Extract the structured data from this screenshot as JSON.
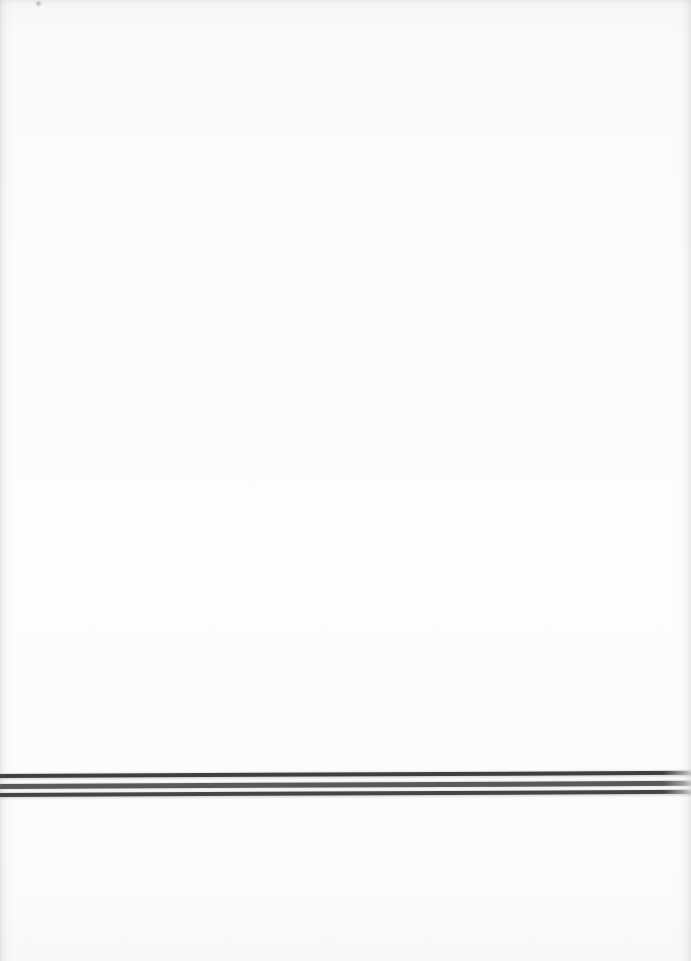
{
  "document": {
    "kind": "scanned-page",
    "page_width": 691,
    "page_height": 961,
    "paper_color": "#fbfbfb",
    "content_summary": "Blank scanned page with three horizontal dark rules near the bottom",
    "text_content": "",
    "has_text": false
  },
  "rules": {
    "count": 3,
    "left_x": 0,
    "right_x": 691,
    "skew_degrees": -0.26,
    "items": [
      {
        "name": "rule-1",
        "top": 774,
        "thickness": 4.2,
        "color": "#3f3f3f",
        "tone": "darkest"
      },
      {
        "name": "rule-2",
        "top": 783.5,
        "thickness": 4.6,
        "color": "#595959",
        "tone": "medium"
      },
      {
        "name": "rule-3",
        "top": 792.5,
        "thickness": 4.4,
        "color": "#454545",
        "tone": "dark"
      }
    ]
  },
  "artifacts": {
    "speck": {
      "name": "scan-speck",
      "x": 35,
      "y": 0,
      "width": 7,
      "height": 7,
      "color": "#8e8e8e"
    }
  },
  "edges": {
    "left_shadow_color": "#969696",
    "right_shadow_color": "#969696",
    "top_shadow_color": "#a5a5a5"
  }
}
